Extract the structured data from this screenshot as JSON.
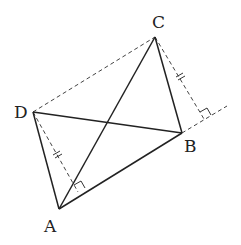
{
  "diagram": {
    "type": "geometry",
    "points": {
      "A": {
        "label": "A",
        "x": 59,
        "y": 209
      },
      "B": {
        "label": "B",
        "x": 182,
        "y": 133
      },
      "C": {
        "label": "C",
        "x": 155,
        "y": 37
      },
      "D": {
        "label": "D",
        "x": 33,
        "y": 112
      }
    },
    "solid_segments": [
      "AB",
      "BC",
      "CA",
      "AD",
      "DB"
    ],
    "dashed_segments": [
      "DC",
      "D-foot1",
      "C-foot2",
      "B-extension"
    ],
    "perpendicular_feet": [
      {
        "from": "D",
        "foot_x": 78,
        "foot_y": 192,
        "note": "perpendicular to line AB"
      },
      {
        "from": "C",
        "foot_x": 204,
        "foot_y": 119,
        "note": "perpendicular to extension of AB"
      }
    ],
    "equal_length_marks": [
      "D-foot1",
      "C-foot2"
    ],
    "colors": {
      "line": "#222222",
      "dashed": "#444444",
      "background": "#ffffff"
    }
  }
}
